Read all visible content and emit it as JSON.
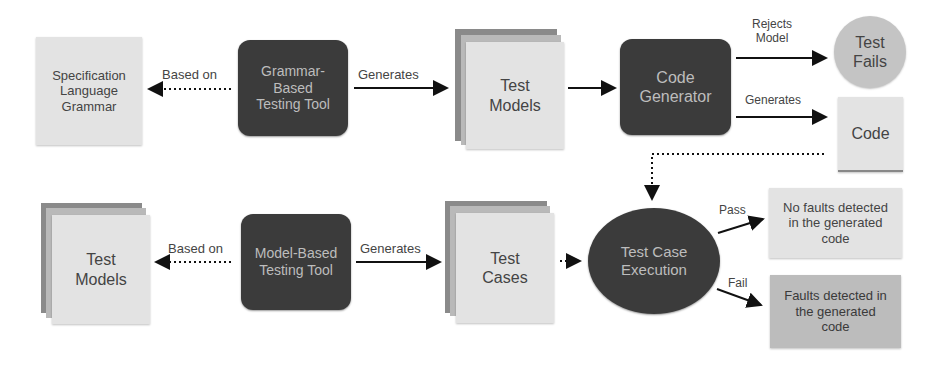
{
  "diagram": {
    "nodes": {
      "spec_grammar": "Specification\nLanguage\nGrammar",
      "grammar_tool": "Grammar-\nBased\nTesting Tool",
      "test_models_top": "Test\nModels",
      "code_generator": "Code\nGenerator",
      "test_fails": "Test\nFails",
      "code": "Code",
      "test_models_bottom": "Test\nModels",
      "model_tool": "Model-Based\nTesting Tool",
      "test_cases": "Test\nCases",
      "test_execution": "Test Case\nExecution",
      "no_faults": "No faults detected\nin the generated\ncode",
      "faults": "Faults detected in\nthe generated\ncode"
    },
    "edges": {
      "based_on_top": "Based on",
      "generates_top": "Generates",
      "rejects_model": "Rejects\nModel",
      "generates_code": "Generates",
      "based_on_bottom": "Based on",
      "generates_bottom": "Generates",
      "pass": "Pass",
      "fail": "Fail"
    },
    "colors": {
      "dark_node": "#3b3b3b",
      "light_node": "#e3e3e3",
      "circle_light": "#c4c4c4",
      "faults_box": "#bcbcbc",
      "arrow": "#111111"
    }
  }
}
